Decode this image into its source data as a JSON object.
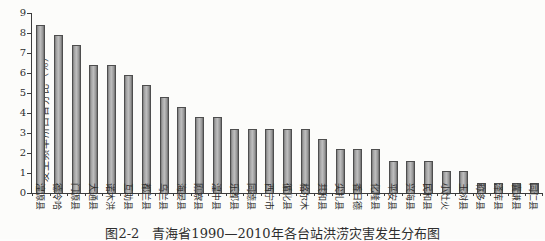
{
  "figure": {
    "caption": "图2-2　青海省1990—2010年各台站洪涝灾害发生分布图"
  },
  "chart_data": {
    "type": "bar",
    "title": "图2-2　青海省1990—2010年各台站洪涝灾害发生分布图",
    "ylabel": "发生频率所占百分比（%）",
    "xlabel": "",
    "ylim": [
      0,
      9
    ],
    "yticks": [
      0,
      1,
      2,
      3,
      4,
      5,
      6,
      7,
      8,
      9
    ],
    "grid": false,
    "legend": null,
    "bar_color": "#a6a6a6",
    "categories": [
      "湟源县",
      "德令哈",
      "门源县",
      "大通县",
      "诺木洪",
      "互助县",
      "都兰县",
      "乌兰县",
      "海晏县",
      "刚察县",
      "湟中县",
      "乐都县",
      "同德县",
      "西宁市",
      "循化县",
      "格尔木",
      "共和县",
      "尖扎县",
      "香日德",
      "化隆县",
      "平安县",
      "兴海县",
      "民和县",
      "小灶火",
      "玉树县",
      "称多县",
      "泽库县",
      "囊谦县",
      "同仁县"
    ],
    "values": [
      8.4,
      7.9,
      7.4,
      6.4,
      6.4,
      5.9,
      5.4,
      4.8,
      4.3,
      3.8,
      3.8,
      3.2,
      3.2,
      3.2,
      3.2,
      3.2,
      2.7,
      2.2,
      2.2,
      2.2,
      1.6,
      1.6,
      1.6,
      1.1,
      1.1,
      0.5,
      0.5,
      0.5,
      0.5
    ]
  }
}
